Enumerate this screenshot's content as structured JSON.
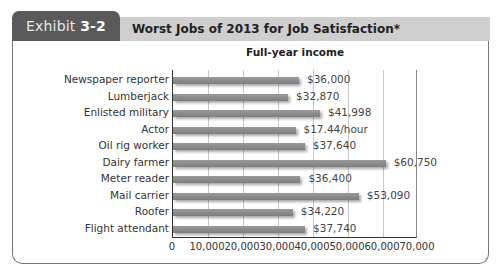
{
  "exhibit": {
    "prefix": "Exhibit",
    "number": "3-2"
  },
  "header": {
    "title": "Worst Jobs of 2013 for Job Satisfaction*"
  },
  "chart_data": {
    "type": "bar",
    "orientation": "horizontal",
    "title": "Full-year income",
    "categories": [
      "Newspaper reporter",
      "Lumberjack",
      "Enlisted military",
      "Actor",
      "Oil rig worker",
      "Dairy farmer",
      "Meter reader",
      "Mail carrier",
      "Roofer",
      "Flight attendant"
    ],
    "values": [
      36000,
      32870,
      41998,
      35000,
      37640,
      60750,
      36400,
      53090,
      34220,
      37740
    ],
    "value_labels": [
      "$36,000",
      "$32,870",
      "$41,998",
      "$17.44/hour",
      "$37,640",
      "$60,750",
      "$36,400",
      "$53,090",
      "$34,220",
      "$37,740"
    ],
    "xlabel": "",
    "ylabel": "",
    "xlim": [
      0,
      70000
    ],
    "xticks": [
      "0",
      "10,000",
      "20,000",
      "30,000",
      "40,000",
      "50,000",
      "60,000",
      "70,000"
    ],
    "grid": true,
    "bar_color": "#8c8c8c"
  }
}
